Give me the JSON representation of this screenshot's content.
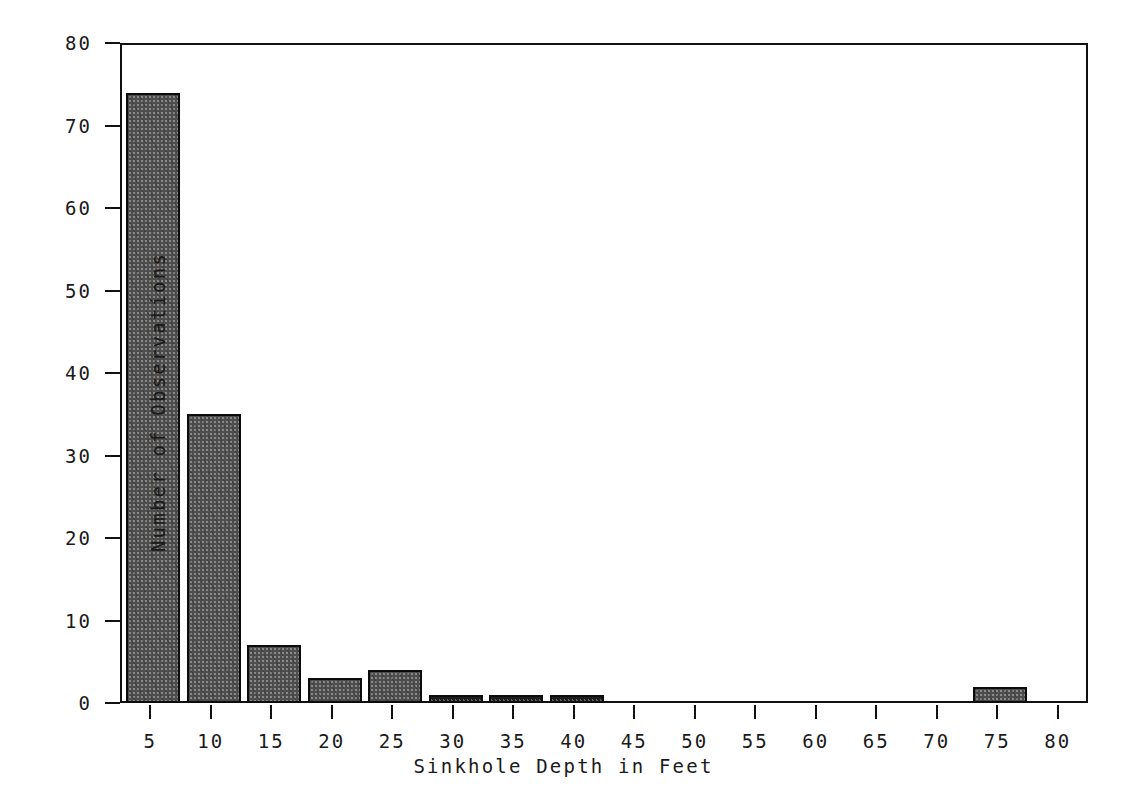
{
  "chart_data": {
    "type": "bar",
    "title": "",
    "subtitle": "",
    "xlabel": "Sinkhole Depth in Feet",
    "ylabel": "Number of Observations",
    "xlim": [
      2.5,
      82.5
    ],
    "ylim": [
      0,
      80
    ],
    "grid": false,
    "legend": "none",
    "bin_width": 5,
    "x_tick_labels": [
      "5",
      "10",
      "15",
      "20",
      "25",
      "30",
      "35",
      "40",
      "45",
      "50",
      "55",
      "60",
      "65",
      "70",
      "75",
      "80"
    ],
    "x_tick_values": [
      5,
      10,
      15,
      20,
      25,
      30,
      35,
      40,
      45,
      50,
      55,
      60,
      65,
      70,
      75,
      80
    ],
    "y_tick_labels": [
      "0",
      "10",
      "20",
      "30",
      "40",
      "50",
      "60",
      "70",
      "80"
    ],
    "y_tick_values": [
      0,
      10,
      20,
      30,
      40,
      50,
      60,
      70,
      80
    ],
    "categories": [
      "5",
      "10",
      "15",
      "20",
      "25",
      "30",
      "35",
      "40",
      "45",
      "50",
      "55",
      "60",
      "65",
      "70",
      "75",
      "80"
    ],
    "values": [
      74,
      35,
      7,
      3,
      4,
      1,
      1,
      1,
      0,
      0,
      0,
      0,
      0,
      0,
      2,
      0
    ],
    "bars": [
      {
        "label": "5",
        "center": 5,
        "start": 3,
        "end": 7.5,
        "value": 74,
        "style": "hatched"
      },
      {
        "label": "10",
        "center": 10,
        "start": 8,
        "end": 12.5,
        "value": 35,
        "style": "hatched"
      },
      {
        "label": "15",
        "center": 15,
        "start": 13,
        "end": 17.5,
        "value": 7,
        "style": "hatched"
      },
      {
        "label": "20",
        "center": 20,
        "start": 18,
        "end": 22.5,
        "value": 3,
        "style": "hatched"
      },
      {
        "label": "25",
        "center": 25,
        "start": 23,
        "end": 27.5,
        "value": 4,
        "style": "hatched"
      },
      {
        "label": "30",
        "center": 30,
        "start": 28,
        "end": 32.5,
        "value": 1,
        "style": "solid"
      },
      {
        "label": "35",
        "center": 35,
        "start": 33,
        "end": 37.5,
        "value": 1,
        "style": "solid"
      },
      {
        "label": "40",
        "center": 40,
        "start": 38,
        "end": 42.5,
        "value": 1,
        "style": "solid"
      },
      {
        "label": "75",
        "center": 75,
        "start": 73,
        "end": 77.5,
        "value": 2,
        "style": "hatched"
      }
    ]
  },
  "colors": {
    "axis": "#111111",
    "text": "#1a1a1a",
    "bar_fill": "#8a8a8a",
    "bar_edge": "#0c0c0c",
    "background": "#ffffff"
  }
}
